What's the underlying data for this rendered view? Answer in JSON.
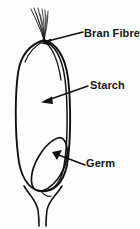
{
  "diagram": {
    "background_color": "#fdfdfd",
    "ink_color": "#111111",
    "labels": [
      {
        "id": "bran-fibre",
        "text": "Bran  Fibre",
        "points_to": "bran layer / outer coat at top of grain",
        "leader_from": [
          84,
          33
        ],
        "arrow_tip": [
          40,
          44
        ]
      },
      {
        "id": "starch",
        "text": "Starch",
        "points_to": "endosperm interior of grain",
        "leader_from": [
          88,
          85
        ],
        "arrow_tip": [
          42,
          100
        ]
      },
      {
        "id": "germ",
        "text": "Germ",
        "points_to": "embryo oval at lower part of grain",
        "leader_from": [
          84,
          163
        ],
        "arrow_tip": [
          53,
          152
        ]
      }
    ],
    "parts": [
      {
        "id": "brush-hairs",
        "name": "Brush hairs at crown"
      },
      {
        "id": "outer-coat",
        "name": "Bran outer coat outline"
      },
      {
        "id": "inner-coat",
        "name": "Inner bran line"
      },
      {
        "id": "germ-oval",
        "name": "Germ oval"
      },
      {
        "id": "stalk",
        "name": "Stalk at base"
      }
    ]
  }
}
